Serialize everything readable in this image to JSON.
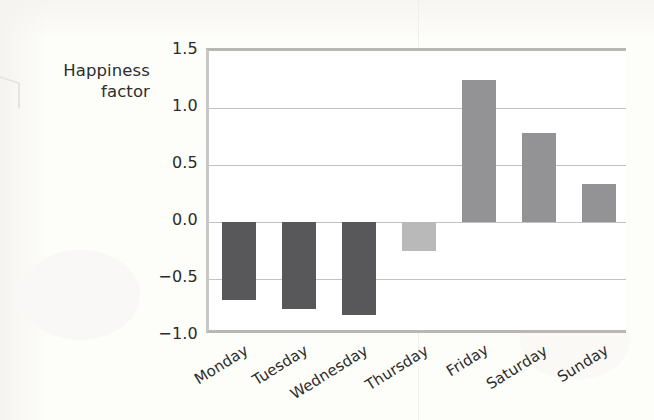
{
  "chart_data": {
    "type": "bar",
    "title": "",
    "subtitle": "",
    "xlabel": "",
    "ylabel": "Happiness factor",
    "ylabel_lines": [
      "Happiness",
      "factor"
    ],
    "categories": [
      "Monday",
      "Tuesday",
      "Wednesday",
      "Thursday",
      "Friday",
      "Saturday",
      "Sunday"
    ],
    "values": [
      -0.68,
      -0.76,
      -0.82,
      -0.25,
      1.25,
      0.78,
      0.33
    ],
    "bar_colors": [
      "#58585a",
      "#58585a",
      "#58585a",
      "#b9b9b9",
      "#939395",
      "#939395",
      "#939395"
    ],
    "ylim": [
      -1.0,
      1.5
    ],
    "yticks": [
      1.5,
      1.0,
      0.5,
      0.0,
      -0.5,
      -1.0
    ],
    "ytick_labels": [
      "1.5",
      "1.0",
      "0.5",
      "0.0",
      "−0.5",
      "−1.0"
    ],
    "gridlines": [
      1.0,
      0.5,
      0.0,
      -0.5
    ],
    "grid": true,
    "legend": "none",
    "xtick_rotation": -32,
    "frame": {
      "top": true,
      "bottom": true,
      "left": true,
      "right": false
    },
    "colors": {
      "grid": "#c4c2c0",
      "axis": "#b9b7b4",
      "text": "#2b2b2b",
      "plot_background": "#ffffff",
      "page_background": "#fdfdfa",
      "negative_bar": "#58585a",
      "positive_bar": "#939395",
      "muted_bar": "#b9b9b9"
    }
  }
}
